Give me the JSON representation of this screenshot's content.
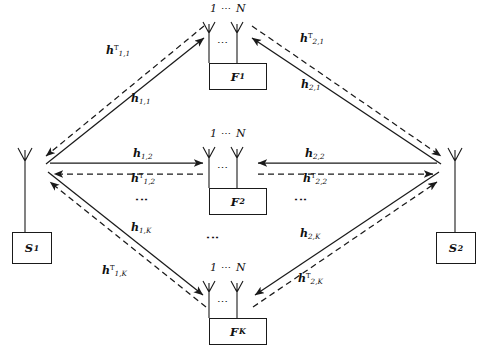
{
  "figure": {
    "type": "two-way-multi-relay-network-diagram",
    "canvas": {
      "width": 486,
      "height": 362
    },
    "stroke_color": "#1a1a1a",
    "background_color": "#ffffff"
  },
  "sources": [
    {
      "id": "S1",
      "label": "S",
      "subscript": "1",
      "antennas": 1,
      "x": 12,
      "y": 232
    },
    {
      "id": "S2",
      "label": "S",
      "subscript": "2",
      "antennas": 1,
      "x": 436,
      "y": 232
    }
  ],
  "relays": [
    {
      "id": "F1",
      "label": "F",
      "subscript": "1",
      "caption_first": "1",
      "caption_dots": "⋯",
      "caption_last": "N",
      "mid_dots": "⋯",
      "box_x": 209,
      "box_y": 63
    },
    {
      "id": "F2",
      "label": "F",
      "subscript": "2",
      "caption_first": "1",
      "caption_dots": "⋯",
      "caption_last": "N",
      "mid_dots": "⋯",
      "box_x": 209,
      "box_y": 188
    },
    {
      "id": "FK",
      "label": "F",
      "subscript": "K",
      "caption_first": "1",
      "caption_dots": "⋯",
      "caption_last": "N",
      "mid_dots": "⋯",
      "box_x": 209,
      "box_y": 318
    }
  ],
  "vertical_ellipses": [
    {
      "id": "left-column-dots",
      "glyph": "⋮",
      "x": 138,
      "y": 196
    },
    {
      "id": "center-column-dots",
      "glyph": "⋮",
      "x": 209,
      "y": 232
    },
    {
      "id": "right-column-dots",
      "glyph": "⋮",
      "x": 297,
      "y": 196
    }
  ],
  "channels": [
    {
      "id": "h-1-1-T",
      "h": "h",
      "sup": "T",
      "sub": "1,1",
      "x": 106,
      "y": 45,
      "path": "S1-F1",
      "direction": "relay-to-source",
      "line": "dashed"
    },
    {
      "id": "h-1-1",
      "h": "h",
      "sup": "",
      "sub": "1,1",
      "x": 131,
      "y": 93,
      "path": "S1-F1",
      "direction": "source-to-relay",
      "line": "solid"
    },
    {
      "id": "h-2-1-T",
      "h": "h",
      "sup": "T",
      "sub": "2,1",
      "x": 300,
      "y": 33,
      "path": "S2-F1",
      "direction": "relay-to-source",
      "line": "dashed"
    },
    {
      "id": "h-2-1",
      "h": "h",
      "sup": "",
      "sub": "2,1",
      "x": 301,
      "y": 79,
      "path": "S2-F1",
      "direction": "source-to-relay",
      "line": "solid"
    },
    {
      "id": "h-1-2",
      "h": "h",
      "sup": "",
      "sub": "1,2",
      "x": 133,
      "y": 148,
      "path": "S1-F2",
      "direction": "source-to-relay",
      "line": "solid"
    },
    {
      "id": "h-1-2-T",
      "h": "h",
      "sup": "T",
      "sub": "1,2",
      "x": 131,
      "y": 173,
      "path": "S1-F2",
      "direction": "relay-to-source",
      "line": "dashed"
    },
    {
      "id": "h-2-2",
      "h": "h",
      "sup": "",
      "sub": "2,2",
      "x": 305,
      "y": 148,
      "path": "S2-F2",
      "direction": "source-to-relay",
      "line": "solid"
    },
    {
      "id": "h-2-2-T",
      "h": "h",
      "sup": "T",
      "sub": "2,2",
      "x": 303,
      "y": 173,
      "path": "S2-F2",
      "direction": "relay-to-source",
      "line": "dashed"
    },
    {
      "id": "h-1-K",
      "h": "h",
      "sup": "",
      "sub": "1,K",
      "x": 131,
      "y": 222,
      "path": "S1-FK",
      "direction": "source-to-relay",
      "line": "solid"
    },
    {
      "id": "h-1-K-T",
      "h": "h",
      "sup": "T",
      "sub": "1,K",
      "x": 102,
      "y": 265,
      "path": "S1-FK",
      "direction": "relay-to-source",
      "line": "dashed"
    },
    {
      "id": "h-2-K",
      "h": "h",
      "sup": "",
      "sub": "2,K",
      "x": 300,
      "y": 228,
      "path": "S2-FK",
      "direction": "source-to-relay",
      "line": "solid"
    },
    {
      "id": "h-2-K-T",
      "h": "h",
      "sup": "T",
      "sub": "2,K",
      "x": 298,
      "y": 273,
      "path": "S2-FK",
      "direction": "relay-to-source",
      "line": "dashed"
    }
  ]
}
